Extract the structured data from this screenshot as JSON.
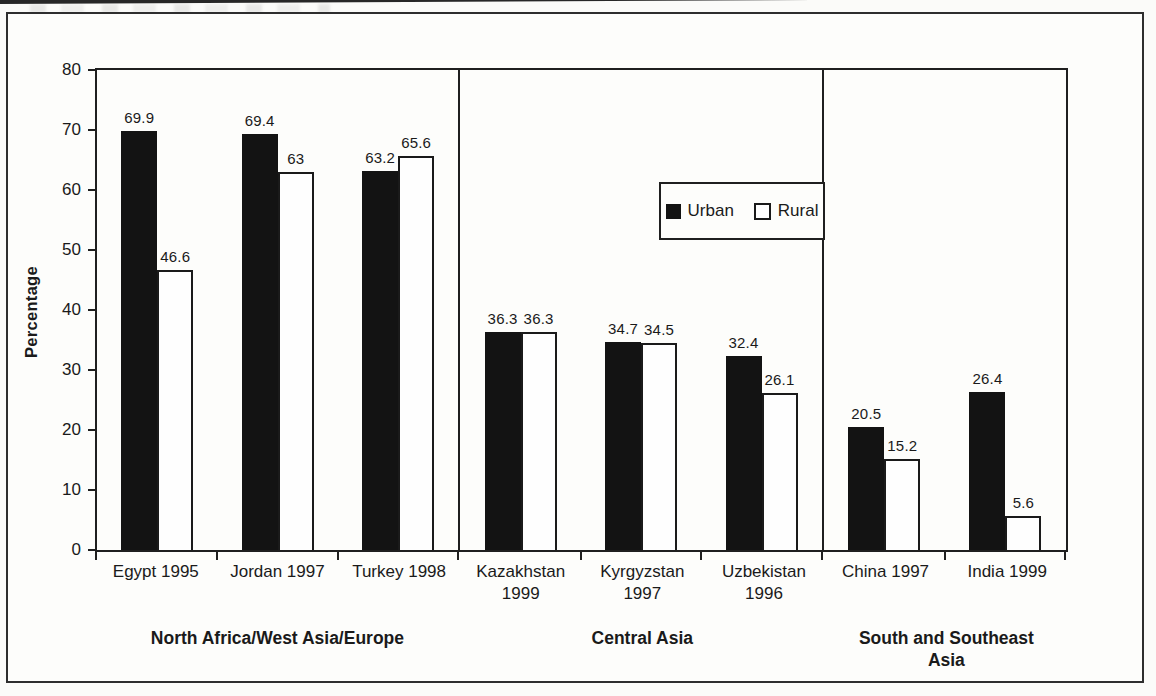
{
  "colors": {
    "bar_urban": "#131313",
    "bar_rural": "#ffffff",
    "line": "#1f1f1f",
    "paper": "#fdfdfb"
  },
  "legend": {
    "items": [
      "Urban",
      "Rural"
    ]
  },
  "chart_data": {
    "type": "bar",
    "title": "",
    "xlabel": "",
    "ylabel": "Percentage",
    "ylim": [
      0,
      80
    ],
    "yticks": [
      0,
      10,
      20,
      30,
      40,
      50,
      60,
      70,
      80
    ],
    "grid": false,
    "legend_position": "top-center",
    "series": [
      "Urban",
      "Rural"
    ],
    "groups": [
      {
        "label": "North Africa/West Asia/Europe",
        "items": [
          {
            "category": "Egypt 1995",
            "urban": 69.9,
            "rural": 46.6
          },
          {
            "category": "Jordan 1997",
            "urban": 69.4,
            "rural": 63
          },
          {
            "category": "Turkey 1998",
            "urban": 63.2,
            "rural": 65.6
          }
        ]
      },
      {
        "label": "Central Asia",
        "items": [
          {
            "category": "Kazakhstan 1999",
            "urban": 36.3,
            "rural": 36.3
          },
          {
            "category": "Kyrgyzstan 1997",
            "urban": 34.7,
            "rural": 34.5
          },
          {
            "category": "Uzbekistan 1996",
            "urban": 32.4,
            "rural": 26.1
          }
        ]
      },
      {
        "label": "South and Southeast Asia",
        "items": [
          {
            "category": "China 1997",
            "urban": 20.5,
            "rural": 15.2
          },
          {
            "category": "India 1999",
            "urban": 26.4,
            "rural": 5.6
          }
        ]
      }
    ]
  }
}
